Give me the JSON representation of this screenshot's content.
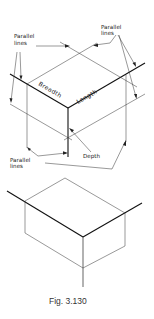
{
  "figure": {
    "caption": "Fig. 3.130",
    "top_diagram": {
      "labels": {
        "parallel_left_1": "Parallel",
        "parallel_left_2": "lines",
        "parallel_right_1": "Parallel",
        "parallel_right_2": "lines",
        "parallel_bottom_1": "Parallel",
        "parallel_bottom_2": "lines",
        "breadth": "Breadth",
        "length": "Length",
        "depth": "Depth"
      }
    },
    "bottom_diagram": {
      "description": "isometric box"
    }
  }
}
